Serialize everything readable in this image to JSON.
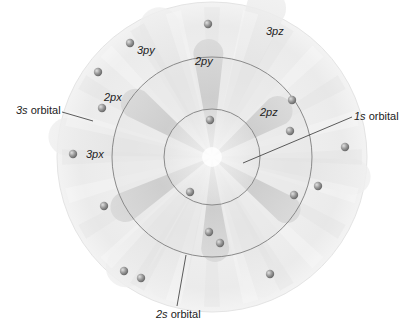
{
  "labels": {
    "orbital_3s": {
      "italic": "3s",
      "rest": " orbital"
    },
    "orbital_1s": {
      "italic": "1s",
      "rest": " orbital"
    },
    "orbital_2s": {
      "italic": "2s",
      "rest": " orbital"
    },
    "p2x": "2px",
    "p2y": "2py",
    "p2z": "2pz",
    "p3x": "3px",
    "p3y": "3py",
    "p3z": "3pz"
  },
  "colors": {
    "background": "#ffffff",
    "shell_3s": "#ececec",
    "shell_2s": "#dedede",
    "shell_1s": "#e8e8e8",
    "lobe_2p": "#cfcfcf",
    "lobe_3p": "#e2e2e2",
    "ring_stroke": "#8a8a8a",
    "electron": "#9a9a9a",
    "leader_line": "#333333"
  },
  "electron_count": 18
}
